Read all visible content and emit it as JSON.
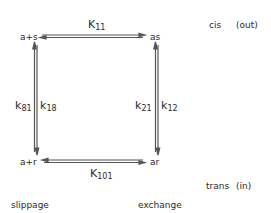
{
  "nodes": {
    "top_left": "a+s",
    "top_right": "as",
    "bottom_left": "a+r",
    "bottom_right": "ar"
  },
  "rate_constants": {
    "top": {
      "symbol": "K",
      "sub": "11"
    },
    "bottom": {
      "symbol": "K",
      "sub": "101"
    },
    "left_outer": {
      "symbol": "k",
      "sub": "81"
    },
    "left_inner": {
      "symbol": "k",
      "sub": "18"
    },
    "right_outer": {
      "symbol": "k",
      "sub": "21"
    },
    "right_inner": {
      "symbol": "k",
      "sub": "12"
    }
  },
  "side_labels": {
    "top": {
      "side": "cis",
      "direction": "(out)"
    },
    "bottom": {
      "side": "trans",
      "direction": "(in)"
    }
  },
  "footer_labels": {
    "left": "slippage",
    "right": "exchange"
  },
  "colors": {
    "line": "#555555",
    "text": "#2a2a2a",
    "background": "#ffffff"
  }
}
